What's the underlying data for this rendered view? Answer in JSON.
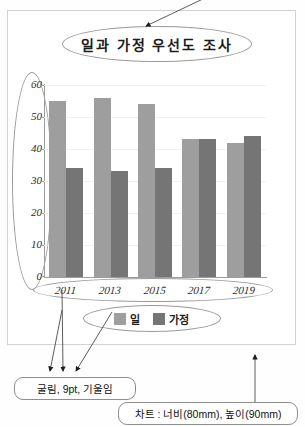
{
  "document": {
    "frame_label": "chart-document-frame"
  },
  "chart_data": {
    "type": "bar",
    "title": "일과 가정 우선도 조사",
    "categories": [
      "2011",
      "2013",
      "2015",
      "2017",
      "2019"
    ],
    "series": [
      {
        "name": "일",
        "values": [
          55,
          56,
          54,
          43,
          42
        ],
        "color": "#9e9e9e"
      },
      {
        "name": "가정",
        "values": [
          34,
          33,
          34,
          43,
          44
        ],
        "color": "#757575"
      }
    ],
    "ylabel": "",
    "xlabel": "",
    "ylim": [
      0,
      60
    ],
    "yticks": [
      "60",
      "50",
      "40",
      "30",
      "20",
      "10",
      "0"
    ],
    "grid": true,
    "legend_position": "bottom"
  },
  "annotations": {
    "title_callout": "일과 가정 우선도 조사",
    "font_callout": "굴림, 9pt, 기울임",
    "chart_callout": "차트 : 너비(80mm), 높이(90mm)"
  },
  "colors": {
    "series_work": "#9e9e9e",
    "series_family": "#757575",
    "outline": "#9a9a9a",
    "frame": "#d2d2d2"
  }
}
